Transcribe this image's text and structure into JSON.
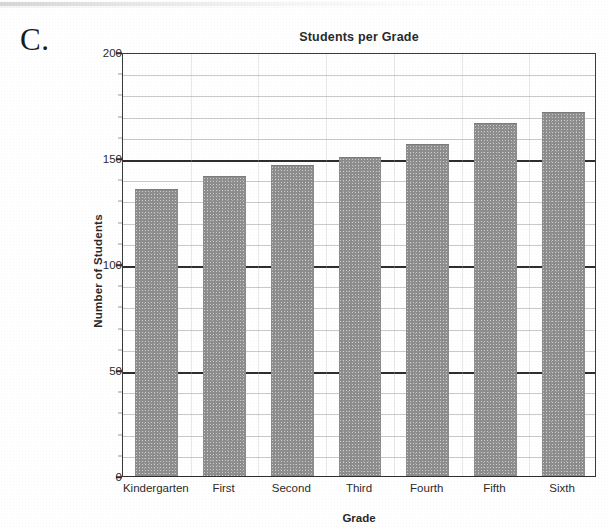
{
  "figure": {
    "label": "C."
  },
  "chart_data": {
    "type": "bar",
    "title": "Students per Grade",
    "xlabel": "Grade",
    "ylabel": "Number of Students",
    "categories": [
      "Kindergarten",
      "First",
      "Second",
      "Third",
      "Fourth",
      "Fifth",
      "Sixth"
    ],
    "values": [
      135,
      141,
      146,
      150,
      156,
      166,
      171
    ],
    "ylim": [
      0,
      200
    ],
    "ymajor_ticks": [
      0,
      50,
      100,
      150,
      200
    ],
    "ymajor_tick_labels": [
      "0",
      "50",
      "100",
      "150",
      "200"
    ],
    "yminor_tick_step": 10,
    "grid": true,
    "legend": null,
    "bar_color": "#8d8d8d",
    "axis_color": "#2e2e2e",
    "gridline_color": "#c9c9c9"
  }
}
